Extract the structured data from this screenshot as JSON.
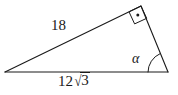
{
  "figure": {
    "type": "geometry-diagram",
    "shape": "right-triangle",
    "background_color": "#ffffff",
    "stroke_color": "#1a1a1a",
    "labels": {
      "hypotenuse": "18",
      "base_coefficient": "12",
      "base_radical_sign": "√",
      "base_radicand": "3",
      "base_full": "12√3",
      "angle": "α"
    },
    "markers": {
      "right_angle": "right-angle-square-with-dot"
    },
    "vertices": {
      "left": [
        5,
        72
      ],
      "right": [
        168,
        72
      ],
      "apex": [
        141,
        6
      ]
    }
  }
}
